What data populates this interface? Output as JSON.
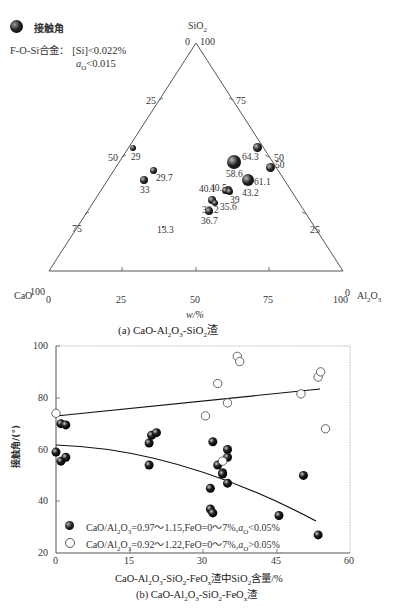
{
  "figure_a": {
    "legend": {
      "marker_label": "接触角",
      "alloy_line": "F-O-Si合金：[Si]<0.022%",
      "ao_line": "a_O<0.015",
      "alloy_prefix": "F-O-Si合金：",
      "alloy_cond": "[Si]<0.022%",
      "ao_symbol": "a",
      "ao_sub": "O",
      "ao_cond": "<0.015"
    },
    "apex_labels": {
      "top": "SiO2",
      "left": "CaO",
      "right": "Al2O3"
    },
    "axis_xlabel": "w/%",
    "caption": "(a) CaO-Al2O3-SiO2渣"
  },
  "figure_b": {
    "ylabel": "接触角/(°)",
    "xlabel": "CaO-Al2O3-SiO2-FeOx渣中SiO2含量/%",
    "caption": "(b) CaO-Al2O3-SiO2-FeOx渣",
    "legend": [
      {
        "marker": "filled",
        "label": "CaO/Al2O3=0.97~1.15,FeO=0~7%,aO<0.05%"
      },
      {
        "marker": "open",
        "label": "CaO/Al2O3=0.92~1.22,FeO=0~7%,aO>0.05%"
      }
    ]
  },
  "chart_data": [
    {
      "type": "scatter",
      "subtype": "ternary",
      "title": "(a) CaO-Al2O3-SiO2渣",
      "axes": [
        "SiO2",
        "CaO",
        "Al2O3"
      ],
      "xlabel": "w/%",
      "ticks": [
        0,
        25,
        50,
        75,
        100
      ],
      "legend": [
        "接触角"
      ],
      "annotation": "F-O-Si合金：[Si]<0.022%, aO<0.015",
      "points": [
        {
          "label": "29",
          "px": 133,
          "py": 148,
          "r": 3
        },
        {
          "label": "29.7",
          "px": 153,
          "py": 170,
          "r": 3.5
        },
        {
          "label": "33",
          "px": 144,
          "py": 180,
          "r": 4
        },
        {
          "label": "64.3",
          "px": 257,
          "py": 147,
          "r": 4.5
        },
        {
          "label": "58.6",
          "px": 234,
          "py": 162,
          "r": 7
        },
        {
          "label": "50",
          "px": 270,
          "py": 167,
          "r": 4.5
        },
        {
          "label": "61.1",
          "px": 248,
          "py": 180,
          "r": 6
        },
        {
          "label": "40.5",
          "px": 228,
          "py": 190,
          "r": 4
        },
        {
          "label": "43.2",
          "px": 248,
          "py": 181,
          "r": 0
        },
        {
          "label": "40.1",
          "px": 225,
          "py": 190,
          "r": 3.5
        },
        {
          "label": "39",
          "px": 229,
          "py": 191,
          "r": 3.5
        },
        {
          "label": "33.2",
          "px": 212,
          "py": 200,
          "r": 4
        },
        {
          "label": "35.6",
          "px": 215,
          "py": 203,
          "r": 3
        },
        {
          "label": "36.7",
          "px": 209,
          "py": 211,
          "r": 4
        },
        {
          "label": "13.3",
          "px": 163,
          "py": 227,
          "r": 1.2
        }
      ]
    },
    {
      "type": "scatter",
      "title": "(b) CaO-Al2O3-SiO2-FeOx渣",
      "xlabel": "CaO-Al2O3-SiO2-FeOx渣中SiO2含量/%",
      "ylabel": "接触角/(°)",
      "xlim": [
        0,
        60
      ],
      "ylim": [
        20,
        100
      ],
      "xticks": [
        0,
        15,
        30,
        45,
        60
      ],
      "yticks": [
        20,
        40,
        60,
        80,
        100
      ],
      "grid": false,
      "legend_position": "lower-left",
      "series": [
        {
          "name": "CaO/Al2O3=0.97~1.15,FeO=0~7%,aO<0.05%",
          "marker": "filled",
          "points": [
            [
              0,
              59
            ],
            [
              1,
              55.5
            ],
            [
              2,
              57
            ],
            [
              1,
              70
            ],
            [
              2,
              69.5
            ],
            [
              19,
              54
            ],
            [
              19,
              62.5
            ],
            [
              19.5,
              65.5
            ],
            [
              20.5,
              66.5
            ],
            [
              32,
              63
            ],
            [
              31.5,
              45
            ],
            [
              31.5,
              37
            ],
            [
              32,
              35.5
            ],
            [
              33,
              54
            ],
            [
              34,
              51
            ],
            [
              34,
              50.5
            ],
            [
              35,
              60
            ],
            [
              35,
              57
            ],
            [
              35,
              47
            ],
            [
              45.5,
              34.5
            ],
            [
              50.5,
              50
            ],
            [
              53.5,
              27
            ]
          ]
        },
        {
          "name": "CaO/Al2O3=0.92~1.22,FeO=0~7%,aO>0.05%",
          "marker": "open",
          "points": [
            [
              0,
              74
            ],
            [
              30.5,
              73
            ],
            [
              33,
              85.5
            ],
            [
              35,
              78
            ],
            [
              37,
              96
            ],
            [
              37.5,
              94
            ],
            [
              34,
              55.5
            ],
            [
              50,
              81.5
            ],
            [
              53.5,
              88
            ],
            [
              54,
              90
            ],
            [
              55,
              68
            ]
          ]
        }
      ],
      "trend_lines": [
        {
          "name": "upper",
          "x": [
            0,
            54
          ],
          "y": [
            73,
            83
          ]
        },
        {
          "name": "lower",
          "x": [
            0,
            53
          ],
          "y": [
            62.5,
            34
          ],
          "curve": "concave-down"
        }
      ]
    }
  ]
}
